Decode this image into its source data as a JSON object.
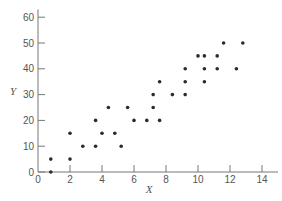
{
  "chart_data": {
    "type": "scatter",
    "title": "",
    "xlabel": "X",
    "ylabel": "Y",
    "xlim": [
      0,
      15
    ],
    "ylim": [
      0,
      63
    ],
    "xticks": [
      0,
      2,
      4,
      6,
      8,
      10,
      12,
      14
    ],
    "yticks": [
      0,
      10,
      20,
      30,
      40,
      50,
      60
    ],
    "grid": false,
    "legend": null,
    "colors": {
      "axis": "#777777",
      "point": "#2a2a2a",
      "text": "#555555"
    },
    "points": [
      {
        "x": 0.8,
        "y": 0
      },
      {
        "x": 0.8,
        "y": 5
      },
      {
        "x": 2.0,
        "y": 5
      },
      {
        "x": 2.0,
        "y": 15
      },
      {
        "x": 2.8,
        "y": 10
      },
      {
        "x": 3.6,
        "y": 10
      },
      {
        "x": 3.6,
        "y": 20
      },
      {
        "x": 4.0,
        "y": 15
      },
      {
        "x": 4.4,
        "y": 25
      },
      {
        "x": 4.8,
        "y": 15
      },
      {
        "x": 5.2,
        "y": 10
      },
      {
        "x": 5.6,
        "y": 25
      },
      {
        "x": 6.0,
        "y": 20
      },
      {
        "x": 6.8,
        "y": 20
      },
      {
        "x": 7.2,
        "y": 25
      },
      {
        "x": 7.2,
        "y": 30
      },
      {
        "x": 7.6,
        "y": 20
      },
      {
        "x": 7.6,
        "y": 35
      },
      {
        "x": 8.4,
        "y": 30
      },
      {
        "x": 9.2,
        "y": 30
      },
      {
        "x": 9.2,
        "y": 35
      },
      {
        "x": 9.2,
        "y": 40
      },
      {
        "x": 10.0,
        "y": 45
      },
      {
        "x": 10.4,
        "y": 35
      },
      {
        "x": 10.4,
        "y": 40
      },
      {
        "x": 10.4,
        "y": 45
      },
      {
        "x": 11.2,
        "y": 40
      },
      {
        "x": 11.2,
        "y": 45
      },
      {
        "x": 11.6,
        "y": 50
      },
      {
        "x": 12.4,
        "y": 40
      },
      {
        "x": 12.8,
        "y": 50
      }
    ]
  }
}
